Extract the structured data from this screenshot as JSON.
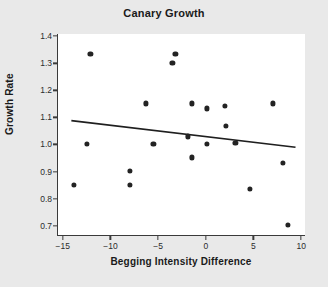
{
  "chart_data": {
    "type": "scatter",
    "title": "Canary Growth",
    "xlabel": "Begging Intensity Difference",
    "ylabel": "Growth Rate",
    "xlim": [
      -15.6,
      10.4
    ],
    "ylim": [
      0.662,
      1.408
    ],
    "grid": false,
    "legend": null,
    "xticks": [
      -15,
      -10,
      -5,
      0,
      5,
      10
    ],
    "xtick_labels": [
      "−15",
      "−10",
      "−5",
      "0",
      "5",
      "10"
    ],
    "yticks": [
      0.7,
      0.8,
      0.9,
      1.0,
      1.1,
      1.2,
      1.3,
      1.4
    ],
    "ytick_labels": [
      "0.7",
      "0.8",
      "0.9",
      "1.0",
      "1.1",
      "1.2",
      "1.3",
      "1.4"
    ],
    "points": [
      {
        "x": -13.9,
        "y": 0.852
      },
      {
        "x": -12.6,
        "y": 1.002
      },
      {
        "x": -12.2,
        "y": 1.333
      },
      {
        "x": -8.1,
        "y": 0.902
      },
      {
        "x": -8.1,
        "y": 0.852
      },
      {
        "x": -6.4,
        "y": 1.152
      },
      {
        "x": -5.6,
        "y": 1.002
      },
      {
        "x": -3.6,
        "y": 1.3
      },
      {
        "x": -3.3,
        "y": 1.333
      },
      {
        "x": -2.0,
        "y": 1.03
      },
      {
        "x": -1.6,
        "y": 1.152
      },
      {
        "x": -1.6,
        "y": 0.952
      },
      {
        "x": 0.0,
        "y": 1.133
      },
      {
        "x": 0.0,
        "y": 1.002
      },
      {
        "x": 1.9,
        "y": 1.143
      },
      {
        "x": 2.0,
        "y": 1.07
      },
      {
        "x": 3.0,
        "y": 1.005
      },
      {
        "x": 4.5,
        "y": 0.835
      },
      {
        "x": 6.9,
        "y": 1.152
      },
      {
        "x": 8.0,
        "y": 0.933
      },
      {
        "x": 8.5,
        "y": 0.702
      }
    ],
    "marker": {
      "shape": "circle",
      "color": "#232323",
      "size": 5.2
    },
    "trend_line": {
      "type": "linear-regression",
      "color": "#1f1f1f",
      "x_start": -14.2,
      "y_start": 1.088,
      "x_end": 9.3,
      "y_end": 0.99
    },
    "colors": {
      "background": "#e9e9e9",
      "plot_background": "#ffffff",
      "axis": "#3a3a3a",
      "text": "#1a1a1a"
    }
  }
}
